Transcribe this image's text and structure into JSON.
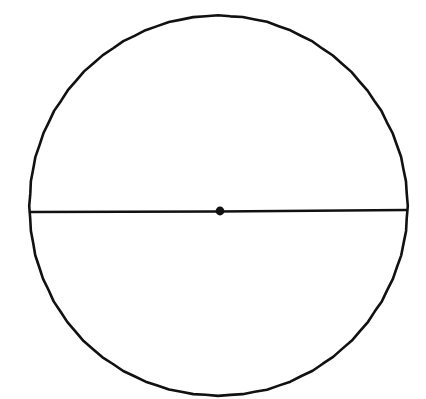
{
  "figure": {
    "background_color": "#ffffff",
    "stroke_color": "#111111",
    "canvas": {
      "width": 426,
      "height": 399
    },
    "caption": "",
    "style": "hand-drawn ink line drawing"
  },
  "chart_data": {
    "type": "diagram",
    "xlabel": "",
    "ylabel": "",
    "shapes": [
      {
        "name": "circle-outline",
        "kind": "circle",
        "center_x": 218,
        "center_y": 206,
        "radius_x": 189,
        "radius_y": 190,
        "stroke": "#111111",
        "stroke_width": 2.6,
        "fill": "none"
      },
      {
        "name": "diameter-line",
        "kind": "line",
        "x1": 30,
        "y1": 212,
        "x2": 406,
        "y2": 210,
        "stroke": "#111111",
        "stroke_width": 2.4
      },
      {
        "name": "center-point",
        "kind": "dot",
        "center_x": 220,
        "center_y": 211,
        "radius": 4.4,
        "fill": "#111111"
      }
    ],
    "labels": [],
    "legend": [],
    "grid": false
  },
  "elements": {
    "circle_label": "circle outline",
    "diameter_label": "horizontal diameter chord",
    "center_label": "center point"
  }
}
